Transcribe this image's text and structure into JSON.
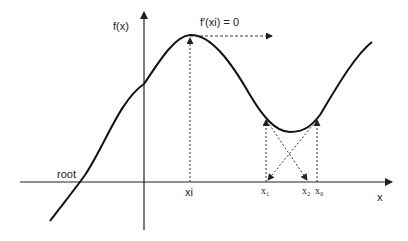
{
  "diagram": {
    "labels": {
      "y_axis": "f(x)",
      "x_axis": "x",
      "root": "root",
      "derivative_zero": "f′(xi) = 0",
      "xi": "xi",
      "x0": "x₀",
      "x1": "x₁",
      "x2": "x₂"
    },
    "colors": {
      "curve": "#111111",
      "axis": "#222222",
      "dashed": "#333333",
      "background": "#ffffff"
    }
  }
}
